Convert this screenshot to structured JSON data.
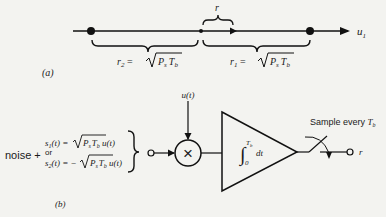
{
  "panel_a": {
    "label": "(a)",
    "axis_label": "u",
    "axis_subscript": "1",
    "top_brace_label": "r",
    "left_brace_label": {
      "lhs": "r",
      "lhs_sub": "2",
      "eq": " = ",
      "rad_P": "P",
      "rad_P_sub": "s",
      "rad_T": "T",
      "rad_T_sub": "b"
    },
    "right_brace_label": {
      "lhs": "r",
      "lhs_sub": "1",
      "eq": " = ",
      "rad_P": "P",
      "rad_P_sub": "s",
      "rad_T": "T",
      "rad_T_sub": "b"
    }
  },
  "panel_b": {
    "label": "(b)",
    "noise_label": "noise +",
    "s1": {
      "name": "s",
      "sub": "1",
      "arg": "(t) = ",
      "rad_P": "P",
      "rad_P_sub": "s",
      "rad_T": "T",
      "rad_T_sub": "b",
      "tail": " u(t)"
    },
    "or_label": "or",
    "s2": {
      "name": "s",
      "sub": "2",
      "arg": "(t) = −",
      "rad_P": "P",
      "rad_P_sub": "s",
      "rad_T": "T",
      "rad_T_sub": "b",
      "tail": " u(t)"
    },
    "multiplier_input_label": "u(t)",
    "multiplier_symbol": "×",
    "integrator": {
      "upper_limit": "T",
      "upper_limit_sub": "b",
      "lower_limit": "0",
      "integral_sign": "∫",
      "differential": "dt"
    },
    "sampler_label": "Sample every ",
    "sampler_label_T": "T",
    "sampler_label_sub": "b",
    "output_label": "r"
  }
}
